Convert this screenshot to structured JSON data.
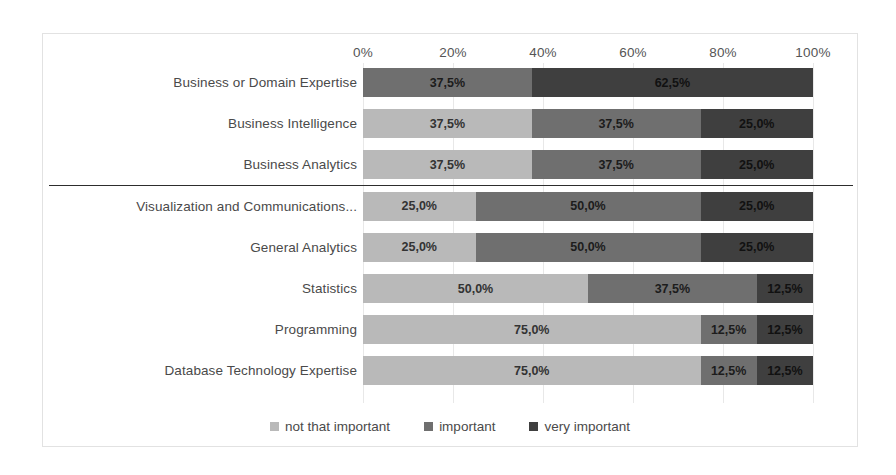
{
  "chart_data": {
    "type": "bar",
    "subtype": "stacked-horizontal-100-percent",
    "title": "",
    "xlabel": "",
    "ylabel": "",
    "xlim": [
      0,
      100
    ],
    "xticks": [
      "0%",
      "20%",
      "40%",
      "60%",
      "80%",
      "100%"
    ],
    "xtick_values": [
      0,
      20,
      40,
      60,
      80,
      100
    ],
    "grid": true,
    "legend_position": "bottom",
    "value_suffix": "%",
    "decimal_separator": ",",
    "categories": [
      "Business or Domain Expertise",
      "Business Intelligence",
      "Business Analytics",
      "Visualization and Communications...",
      "General Analytics",
      "Statistics",
      "Programming",
      "Database Technology Expertise"
    ],
    "series": [
      {
        "name": "not that important",
        "color": "#b9b9b9",
        "values": [
          0,
          37.5,
          37.5,
          25.0,
          25.0,
          50.0,
          75.0,
          75.0
        ],
        "labels": [
          "",
          "37,5%",
          "37,5%",
          "25,0%",
          "25,0%",
          "50,0%",
          "75,0%",
          "75,0%"
        ]
      },
      {
        "name": "important",
        "color": "#6f6f6f",
        "values": [
          37.5,
          37.5,
          37.5,
          50.0,
          50.0,
          37.5,
          12.5,
          12.5
        ],
        "labels": [
          "37,5%",
          "37,5%",
          "37,5%",
          "50,0%",
          "50,0%",
          "37,5%",
          "12,5%",
          "12,5%"
        ]
      },
      {
        "name": "very important",
        "color": "#3f3f3f",
        "values": [
          62.5,
          25.0,
          25.0,
          25.0,
          25.0,
          12.5,
          12.5,
          12.5
        ],
        "labels": [
          "62,5%",
          "25,0%",
          "25,0%",
          "25,0%",
          "25,0%",
          "12,5%",
          "12,5%",
          "12,5%"
        ]
      }
    ],
    "group_divider_after_category_index": 2
  },
  "legend": {
    "items": [
      {
        "label": "not that important",
        "color": "#b9b9b9"
      },
      {
        "label": "important",
        "color": "#6f6f6f"
      },
      {
        "label": "very important",
        "color": "#3f3f3f"
      }
    ]
  }
}
